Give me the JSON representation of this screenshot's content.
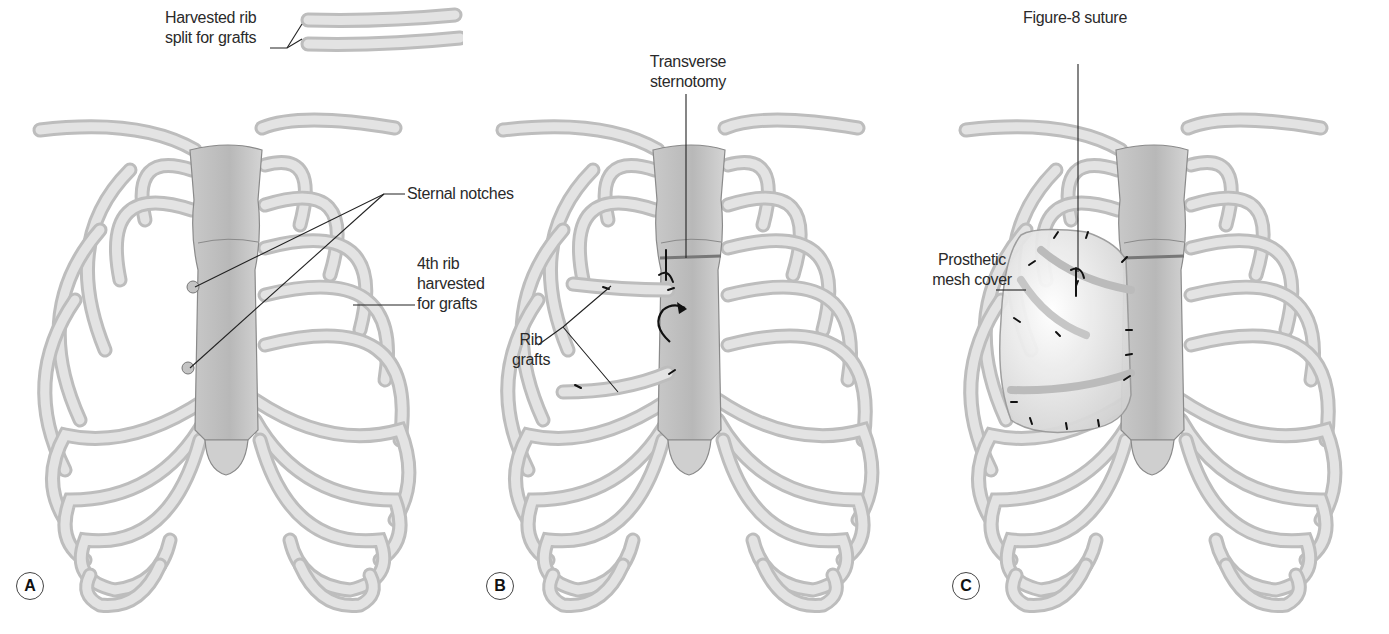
{
  "figure": {
    "panels": [
      {
        "id": "A",
        "letter": "A",
        "labels": {
          "harvested_rib": [
            "Harvested rib",
            "split for grafts"
          ],
          "sternal_notches": "Sternal notches",
          "fourth_rib": [
            "4th rib",
            "harvested",
            "for grafts"
          ]
        }
      },
      {
        "id": "B",
        "letter": "B",
        "labels": {
          "transverse_sternotomy": [
            "Transverse",
            "sternotomy"
          ],
          "rib_grafts": [
            "Rib",
            "grafts"
          ]
        }
      },
      {
        "id": "C",
        "letter": "C",
        "labels": {
          "figure8_suture": "Figure-8 suture",
          "prosthetic_mesh": [
            "Prosthetic",
            "mesh cover"
          ]
        }
      }
    ],
    "colors": {
      "bone_outline": "#9e9e9e",
      "bone_fill": "#d9d9d9",
      "bone_highlight": "#ececec",
      "sternum_fill": "#cfcfcf",
      "mesh_fill": "#f2f2f2",
      "text": "#2a2a2a",
      "suture": "#111111"
    }
  }
}
